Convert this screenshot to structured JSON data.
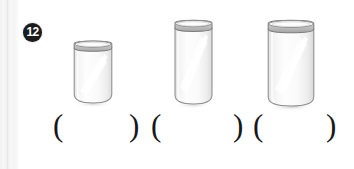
{
  "page": {
    "width": 354,
    "height": 169,
    "background_color": "#ffffff",
    "scan_artifact_color": "#f2f2f2"
  },
  "item": {
    "number_badge": "12",
    "badge_bg_color": "#1c1c1c",
    "badge_text_color": "#ffffff"
  },
  "objects": [
    {
      "name": "drinking-glass-small",
      "label": "glass 1",
      "size_rank": "smallest",
      "x": 72,
      "y": 42,
      "width": 41,
      "height": 62,
      "outline_color": "#8e8e8e",
      "fill_color": "#fbfbfb",
      "highlight_color": "#ffffff"
    },
    {
      "name": "drinking-glass-medium",
      "label": "glass 2",
      "size_rank": "medium",
      "x": 173,
      "y": 21,
      "width": 40,
      "height": 84,
      "outline_color": "#8e8e8e",
      "fill_color": "#fbfbfb",
      "highlight_color": "#ffffff"
    },
    {
      "name": "drinking-glass-large",
      "label": "glass 3",
      "size_rank": "largest",
      "x": 266,
      "y": 21,
      "width": 49,
      "height": 86,
      "outline_color": "#8e8e8e",
      "fill_color": "#fbfbfb",
      "highlight_color": "#ffffff"
    }
  ],
  "answer_slots": [
    {
      "name": "answer-slot-1",
      "open": "(",
      "close": ")",
      "open_x": 53,
      "close_x": 129,
      "value": ""
    },
    {
      "name": "answer-slot-2",
      "open": "(",
      "close": ")",
      "open_x": 151,
      "close_x": 233,
      "value": ""
    },
    {
      "name": "answer-slot-3",
      "open": "(",
      "close": ")",
      "open_x": 253,
      "close_x": 326,
      "value": ""
    }
  ]
}
